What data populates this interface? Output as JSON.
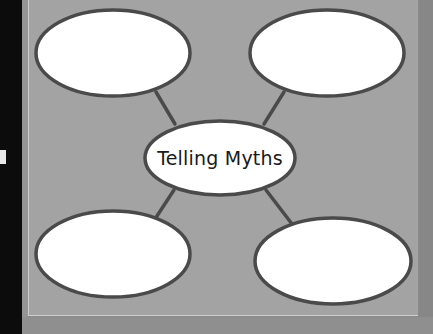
{
  "diagram": {
    "type": "web-organizer",
    "center": {
      "label": "Telling Myths"
    },
    "nodes": [
      {
        "id": "top-left",
        "label": ""
      },
      {
        "id": "top-right",
        "label": ""
      },
      {
        "id": "bottom-left",
        "label": ""
      },
      {
        "id": "bottom-right",
        "label": ""
      }
    ]
  },
  "colors": {
    "panel": "#a3a3a3",
    "ellipse_fill": "#ffffff",
    "ellipse_stroke": "#4a4a4a",
    "connector": "#4a4a4a",
    "left_margin": "#0c0c0c"
  }
}
